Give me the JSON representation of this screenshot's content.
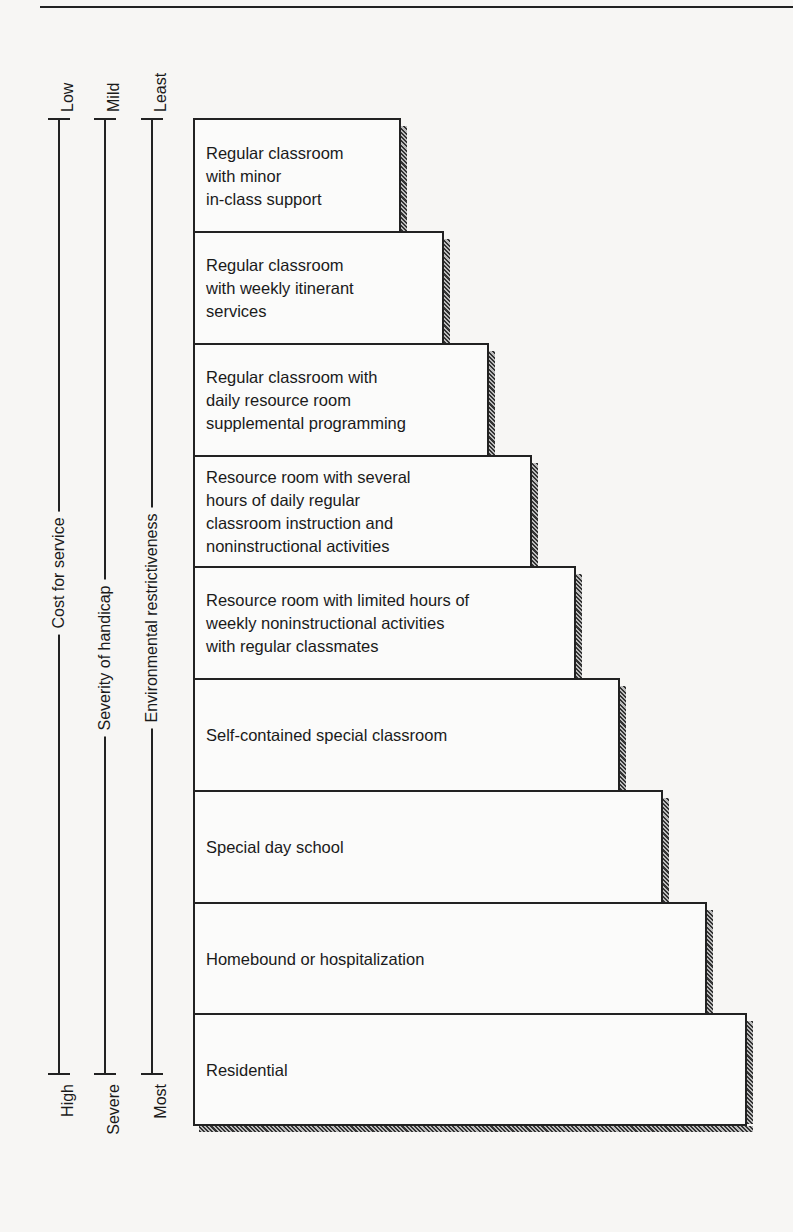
{
  "axes": [
    {
      "name": "cost",
      "label": "Cost for service",
      "top": "Low",
      "bottom": "High",
      "x": 58
    },
    {
      "name": "severity",
      "label": "Severity of handicap",
      "top": "Mild",
      "bottom": "Severe",
      "x": 104
    },
    {
      "name": "restrictiveness",
      "label": "Environmental restrictiveness",
      "top": "Least",
      "bottom": "Most",
      "x": 151
    }
  ],
  "steps": [
    {
      "label": "Regular classroom\nwith minor\nin-class support",
      "top": 118,
      "bottom": 231,
      "right": 401
    },
    {
      "label": "Regular classroom\nwith weekly itinerant\nservices",
      "top": 231,
      "bottom": 343,
      "right": 444
    },
    {
      "label": "Regular classroom with\ndaily resource room\nsupplemental programming",
      "top": 343,
      "bottom": 455,
      "right": 489
    },
    {
      "label": "Resource room with several\nhours of daily regular\nclassroom instruction and\nnoninstructional activities",
      "top": 455,
      "bottom": 566,
      "right": 532
    },
    {
      "label": "Resource room with limited hours of\nweekly noninstructional activities\nwith regular classmates",
      "top": 566,
      "bottom": 678,
      "right": 576
    },
    {
      "label": "Self-contained special classroom",
      "top": 678,
      "bottom": 790,
      "right": 620
    },
    {
      "label": "Special day school",
      "top": 790,
      "bottom": 902,
      "right": 663
    },
    {
      "label": "Homebound or hospitalization",
      "top": 902,
      "bottom": 1013,
      "right": 707
    },
    {
      "label": "Residential",
      "top": 1013,
      "bottom": 1126,
      "right": 747
    }
  ]
}
